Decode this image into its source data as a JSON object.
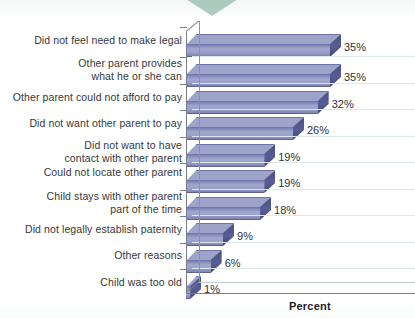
{
  "chart_data": {
    "type": "bar",
    "orientation": "horizontal",
    "title": "",
    "subtitle": "",
    "xlabel": "Percent",
    "ylabel": "",
    "xlim": [
      0,
      40
    ],
    "grid": true,
    "legend": null,
    "categories": [
      "Did not feel need to make legal",
      "Other parent provides\nwhat he or she can",
      "Other parent could not afford to pay",
      "Did not want other parent to pay",
      "Did not want to have\ncontact with other parent",
      "Could not locate other parent",
      "Child stays with other parent\npart of the time",
      "Did not legally establish paternity",
      "Other reasons",
      "Child was too old"
    ],
    "values": [
      35,
      35,
      32,
      26,
      19,
      19,
      18,
      9,
      6,
      1
    ],
    "data_labels": [
      "35%",
      "35%",
      "32%",
      "26%",
      "19%",
      "19%",
      "18%",
      "9%",
      "6%",
      "1%"
    ],
    "series": [
      {
        "name": "Percent",
        "values": [
          35,
          35,
          32,
          26,
          19,
          19,
          18,
          9,
          6,
          1
        ]
      }
    ],
    "style": {
      "bar_fill": "#9aa0ca",
      "bar_shade_dark": "#4a4f85",
      "bar_edge": "#5e6394",
      "axis_color": "#7a7f86",
      "gridline_color": "#dde9e8",
      "ornament_color": "#9fc3b4",
      "background": "#fdfefe",
      "label_color": "#35383c"
    }
  },
  "ornament": {
    "name": "green-triangle"
  }
}
